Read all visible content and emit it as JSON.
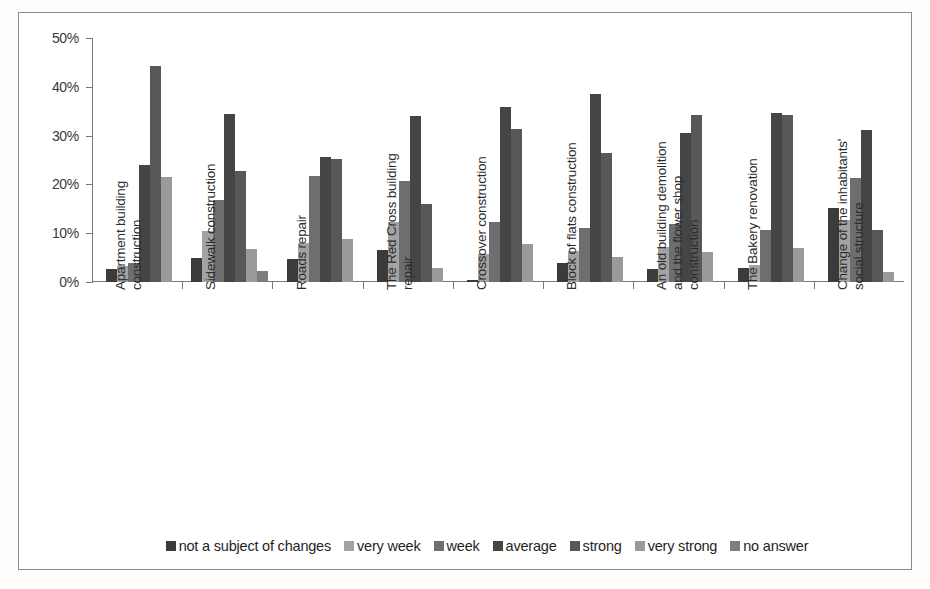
{
  "chart_data": {
    "type": "bar",
    "title": "",
    "subtitle": "",
    "xlabel": "",
    "ylabel": "",
    "ylim": [
      0,
      50
    ],
    "y_ticks": [
      "0%",
      "10%",
      "20%",
      "30%",
      "40%",
      "50%"
    ],
    "grid": false,
    "legend_position": "bottom",
    "categories": [
      "Apartment building\nconstruction",
      "Sidewalk construction",
      "Roads repair",
      "The Red Cross building\nrepair",
      "Crossover construction",
      "Block of flats construction",
      "An old building demolition\nand the flower shop\nconstruction",
      "The Bakery renovation",
      "Change of the inhabitants'\nsocial structure"
    ],
    "series": [
      {
        "name": "not a subject of changes",
        "color": "#3b3b3b",
        "values": [
          2.6,
          4.9,
          4.8,
          6.5,
          0.4,
          3.9,
          2.6,
          2.9,
          15.1
        ]
      },
      {
        "name": "very week",
        "color": "#a3a3a3",
        "values": [
          3.2,
          10.5,
          8.0,
          12.4,
          5.8,
          6.4,
          7.1,
          3.5,
          12.7
        ]
      },
      {
        "name": "week",
        "color": "#6e6e6e",
        "values": [
          3.8,
          16.9,
          21.8,
          20.6,
          12.2,
          11.0,
          11.8,
          10.7,
          21.4
        ]
      },
      {
        "name": "average",
        "color": "#454545",
        "values": [
          23.9,
          34.5,
          25.7,
          34.0,
          35.9,
          38.6,
          30.6,
          34.6,
          31.1
        ]
      },
      {
        "name": "strong",
        "color": "#585858",
        "values": [
          44.2,
          22.7,
          25.3,
          15.9,
          31.3,
          26.5,
          34.2,
          34.2,
          10.7
        ]
      },
      {
        "name": "very strong",
        "color": "#9a9a9a",
        "values": [
          21.6,
          6.7,
          8.8,
          2.8,
          7.7,
          5.1,
          6.1,
          6.9,
          2.0
        ]
      },
      {
        "name": "no answer",
        "color": "#7d7d7d",
        "values": [
          0,
          2.3,
          0,
          0,
          0,
          0,
          0,
          0,
          0
        ]
      }
    ]
  },
  "legend": {
    "items": [
      {
        "label": "not a subject of changes",
        "color": "#3b3b3b"
      },
      {
        "label": "very week",
        "color": "#a3a3a3"
      },
      {
        "label": "week",
        "color": "#6e6e6e"
      },
      {
        "label": "average",
        "color": "#454545"
      },
      {
        "label": "strong",
        "color": "#585858"
      },
      {
        "label": "very strong",
        "color": "#9a9a9a"
      },
      {
        "label": "no answer",
        "color": "#7d7d7d"
      }
    ]
  }
}
